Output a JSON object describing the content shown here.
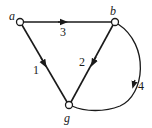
{
  "diagram": {
    "type": "directed-graph",
    "nodes": [
      {
        "id": "a",
        "label": "a"
      },
      {
        "id": "b",
        "label": "b"
      },
      {
        "id": "g",
        "label": "g"
      }
    ],
    "edges": [
      {
        "id": "e1",
        "from": "a",
        "to": "g",
        "label": "1"
      },
      {
        "id": "e2",
        "from": "b",
        "to": "g",
        "label": "2"
      },
      {
        "id": "e3",
        "from": "a",
        "to": "b",
        "label": "3"
      },
      {
        "id": "e4",
        "from": "b",
        "to": "g",
        "label": "4",
        "curved": true
      }
    ],
    "colors": {
      "line": "#1a1a1a",
      "node_fill": "#ffffff",
      "background": "#ffffff"
    }
  }
}
